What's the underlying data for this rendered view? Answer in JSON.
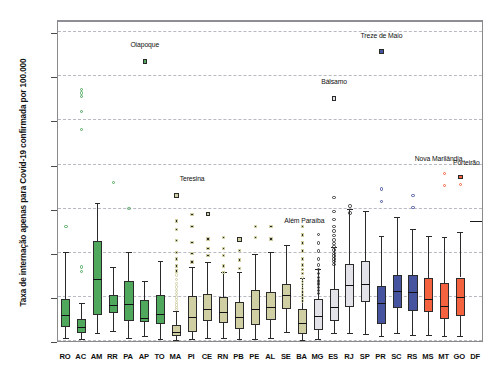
{
  "chart_data": {
    "type": "boxplot",
    "title": "",
    "xlabel": "",
    "ylabel": "Taxa de internação apenas para Covid-19 confirmada por 100.000",
    "ylim": [
      0,
      1460
    ],
    "yticks": [
      0,
      200,
      400,
      600,
      800,
      1000,
      1200,
      1400
    ],
    "ytick_labels": [
      "0",
      "200",
      "400",
      "600",
      "800",
      "1.000",
      "1.200",
      "1.400"
    ],
    "grid": "horizontal-dashed",
    "legend": "none",
    "categories": [
      "RO",
      "AC",
      "AM",
      "RR",
      "PA",
      "AP",
      "TO",
      "MA",
      "PI",
      "CE",
      "RN",
      "PB",
      "PE",
      "AL",
      "SE",
      "BA",
      "MG",
      "ES",
      "RJ",
      "SP",
      "PR",
      "SC",
      "RS",
      "MS",
      "MT",
      "GO",
      "DF"
    ],
    "group_colors": {
      "north": "#4fa85c",
      "northeast": "#cfcfa3",
      "southeast": "#e2e2e8",
      "south": "#46539e",
      "centerwest": "#f4623f"
    },
    "series": [
      {
        "cat": "RO",
        "group": "north",
        "color": "#4fa85c",
        "min": 8,
        "q1": 62,
        "median": 112,
        "q3": 192,
        "max": 400,
        "outliers": [
          520
        ],
        "extremes": []
      },
      {
        "cat": "AC",
        "group": "north",
        "color": "#4fa85c",
        "min": 5,
        "q1": 38,
        "median": 60,
        "q3": 100,
        "max": 168,
        "outliers": [
          960,
          1040,
          1110,
          1125,
          1140,
          315,
          335
        ],
        "extremes": []
      },
      {
        "cat": "AM",
        "group": "north",
        "color": "#4fa85c",
        "min": 30,
        "q1": 118,
        "median": 278,
        "q3": 455,
        "max": 620,
        "outliers": [],
        "extremes": []
      },
      {
        "cat": "RR",
        "group": "north",
        "color": "#4fa85c",
        "min": 40,
        "q1": 128,
        "median": 158,
        "q3": 208,
        "max": 330,
        "outliers": [
          720
        ],
        "extremes": []
      },
      {
        "cat": "PA",
        "group": "north",
        "color": "#4fa85c",
        "min": 8,
        "q1": 92,
        "median": 163,
        "q3": 270,
        "max": 400,
        "outliers": [
          600
        ],
        "extremes": []
      },
      {
        "cat": "AP",
        "group": "north",
        "color": "#4fa85c",
        "min": 18,
        "q1": 85,
        "median": 100,
        "q3": 188,
        "max": 268,
        "outliers": [
          1268
        ],
        "extremes": [
          1268
        ]
      },
      {
        "cat": "TO",
        "group": "north",
        "color": "#4fa85c",
        "min": 5,
        "q1": 75,
        "median": 120,
        "q3": 208,
        "max": 360,
        "outliers": [],
        "extremes": []
      },
      {
        "cat": "MA",
        "group": "northeast",
        "color": "#cfcfa3",
        "min": 2,
        "q1": 22,
        "median": 38,
        "q3": 72,
        "max": 130,
        "outliers": [
          660,
          545,
          505,
          455,
          400,
          372,
          340,
          318,
          300,
          280,
          262,
          245,
          230,
          215,
          200,
          188,
          175,
          163,
          152,
          142
        ],
        "extremes": [
          660
        ]
      },
      {
        "cat": "PI",
        "group": "northeast",
        "color": "#cfcfa3",
        "min": 5,
        "q1": 42,
        "median": 105,
        "q3": 202,
        "max": 330,
        "outliers": [
          575,
          520,
          448,
          398,
          358
        ],
        "extremes": []
      },
      {
        "cat": "CE",
        "group": "northeast",
        "color": "#cfcfa3",
        "min": 8,
        "q1": 92,
        "median": 140,
        "q3": 215,
        "max": 352,
        "outliers": [
          575,
          462,
          420,
          388
        ],
        "extremes": [
          575
        ]
      },
      {
        "cat": "RN",
        "group": "northeast",
        "color": "#cfcfa3",
        "min": 10,
        "q1": 80,
        "median": 128,
        "q3": 200,
        "max": 310,
        "outliers": [
          470,
          420,
          388,
          340,
          310
        ],
        "extremes": []
      },
      {
        "cat": "PB",
        "group": "northeast",
        "color": "#cfcfa3",
        "min": 6,
        "q1": 55,
        "median": 105,
        "q3": 175,
        "max": 310,
        "outliers": [
          460,
          410,
          368,
          330
        ],
        "extremes": [
          460
        ]
      },
      {
        "cat": "PE",
        "group": "northeast",
        "color": "#cfcfa3",
        "min": 5,
        "q1": 72,
        "median": 140,
        "q3": 230,
        "max": 392,
        "outliers": [
          518,
          470
        ],
        "extremes": []
      },
      {
        "cat": "AL",
        "group": "northeast",
        "color": "#cfcfa3",
        "min": 10,
        "q1": 95,
        "median": 150,
        "q3": 222,
        "max": 400,
        "outliers": [
          520,
          462
        ],
        "extremes": []
      },
      {
        "cat": "SE",
        "group": "northeast",
        "color": "#cfcfa3",
        "min": 35,
        "q1": 145,
        "median": 202,
        "q3": 258,
        "max": 432,
        "outliers": [],
        "extremes": []
      },
      {
        "cat": "BA",
        "group": "northeast",
        "color": "#cfcfa3",
        "min": 2,
        "q1": 30,
        "median": 78,
        "q3": 145,
        "max": 280,
        "outliers": [
          520,
          480,
          445,
          408,
          372,
          345,
          325,
          305,
          288,
          270,
          255,
          238,
          222,
          208,
          195,
          182
        ],
        "extremes": []
      },
      {
        "cat": "MG",
        "group": "southeast",
        "color": "#e2e2e8",
        "min": 3,
        "q1": 50,
        "median": 110,
        "q3": 190,
        "max": 320,
        "outliers": [
          482,
          445,
          408,
          372,
          345,
          325,
          305,
          288,
          272,
          258,
          242,
          228,
          215
        ],
        "extremes": []
      },
      {
        "cat": "ES",
        "group": "southeast",
        "color": "#e2e2e8",
        "min": 30,
        "q1": 92,
        "median": 148,
        "q3": 238,
        "max": 420,
        "outliers": [
          1100,
          650,
          588,
          552,
          520,
          498,
          478,
          458,
          442,
          428,
          412,
          398,
          385,
          372,
          360,
          348
        ],
        "extremes": [
          1100
        ]
      },
      {
        "cat": "RJ",
        "group": "southeast",
        "color": "#e2e2e8",
        "min": 30,
        "q1": 155,
        "median": 248,
        "q3": 350,
        "max": 595,
        "outliers": [
          612,
          580
        ],
        "extremes": []
      },
      {
        "cat": "SP",
        "group": "southeast",
        "color": "#e2e2e8",
        "min": 28,
        "q1": 175,
        "median": 255,
        "q3": 365,
        "max": 585,
        "outliers": [],
        "extremes": []
      },
      {
        "cat": "PR",
        "group": "south",
        "color": "#46539e",
        "min": 18,
        "q1": 78,
        "median": 170,
        "q3": 250,
        "max": 470,
        "outliers": [
          1312,
          690,
          632
        ],
        "extremes": [
          1312
        ]
      },
      {
        "cat": "SC",
        "group": "south",
        "color": "#46539e",
        "min": 30,
        "q1": 148,
        "median": 220,
        "q3": 300,
        "max": 560,
        "outliers": [],
        "extremes": []
      },
      {
        "cat": "RS",
        "group": "south",
        "color": "#46539e",
        "min": 25,
        "q1": 138,
        "median": 218,
        "q3": 298,
        "max": 505,
        "outliers": [
          660,
          605
        ],
        "extremes": []
      },
      {
        "cat": "MS",
        "group": "centerwest",
        "color": "#f4623f",
        "min": 22,
        "q1": 130,
        "median": 185,
        "q3": 285,
        "max": 470,
        "outliers": [],
        "extremes": []
      },
      {
        "cat": "MT",
        "group": "centerwest",
        "color": "#f4623f",
        "min": 20,
        "q1": 100,
        "median": 155,
        "q3": 265,
        "max": 468,
        "outliers": [
          760,
          705
        ],
        "extremes": []
      },
      {
        "cat": "GO",
        "group": "centerwest",
        "color": "#f4623f",
        "min": 18,
        "q1": 112,
        "median": 195,
        "q3": 288,
        "max": 490,
        "outliers": [
          745,
          710
        ],
        "extremes": [
          745
        ]
      },
      {
        "cat": "DF",
        "group": "centerwest",
        "color": "#f4623f",
        "min": 540,
        "q1": 540,
        "median": 540,
        "q3": 540,
        "max": 540,
        "outliers": [],
        "extremes": [],
        "single_value": true
      }
    ],
    "annotations": [
      {
        "label": "Oiapoque",
        "cat": "AP",
        "value": 1268
      },
      {
        "label": "Teresina",
        "cat": "PI",
        "value": 660
      },
      {
        "label": "Além Paraíba",
        "cat": "MG",
        "value": 482
      },
      {
        "label": "Bálsamo",
        "cat": "ES",
        "value": 1100
      },
      {
        "label": "Treze de Maio",
        "cat": "PR",
        "value": 1312
      },
      {
        "label": "Nova Marilândia",
        "cat": "MT",
        "value": 760
      },
      {
        "label": "Porteirão",
        "cat": "GO",
        "value": 745
      }
    ]
  }
}
